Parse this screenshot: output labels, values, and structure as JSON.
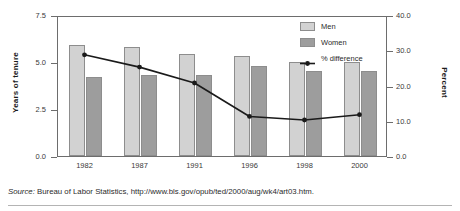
{
  "chart_data": {
    "type": "bar",
    "title": "",
    "subtitle": "",
    "categories": [
      "1982",
      "1987",
      "1991",
      "1996",
      "1998",
      "2000"
    ],
    "series": [
      {
        "name": "Men",
        "axis": "left",
        "values": [
          5.9,
          5.8,
          5.4,
          5.3,
          5.0,
          5.0
        ]
      },
      {
        "name": "Women",
        "axis": "left",
        "values": [
          4.2,
          4.3,
          4.3,
          4.8,
          4.5,
          4.5
        ]
      },
      {
        "name": "% difference",
        "axis": "right",
        "type": "line",
        "values": [
          29.0,
          25.5,
          21.0,
          11.5,
          10.5,
          12.0
        ]
      }
    ],
    "xlabel": "",
    "ylabel": "Years of tenure",
    "ylabel_right": "Percent",
    "ylim": [
      0.0,
      7.5
    ],
    "ylim_right": [
      0.0,
      40.0
    ],
    "yticks": [
      "0.0",
      "2.5",
      "5.0",
      "7.5"
    ],
    "ytick_values": [
      0.0,
      2.5,
      5.0,
      7.5
    ],
    "yticks_right": [
      "0.0",
      "10.0",
      "20.0",
      "30.0",
      "40.0"
    ],
    "ytick_values_right": [
      0.0,
      10.0,
      20.0,
      30.0,
      40.0
    ],
    "grid": false,
    "legend_position": "top-right",
    "colors": {
      "men": "#d2d2d2",
      "women": "#9d9d9d",
      "line": "#1a1a1a",
      "frame": "#6d6d6d"
    }
  },
  "legend": {
    "items": [
      {
        "label": "Men",
        "marker": "swatch-light"
      },
      {
        "label": "Women",
        "marker": "swatch-dark"
      },
      {
        "label": "% difference",
        "marker": "line-with-dot"
      }
    ]
  },
  "source": {
    "prefix": "Source:",
    "text": " Bureau of Labor Statistics, http://www.bls.gov/opub/ted/2000/aug/wk4/art03.htm."
  }
}
